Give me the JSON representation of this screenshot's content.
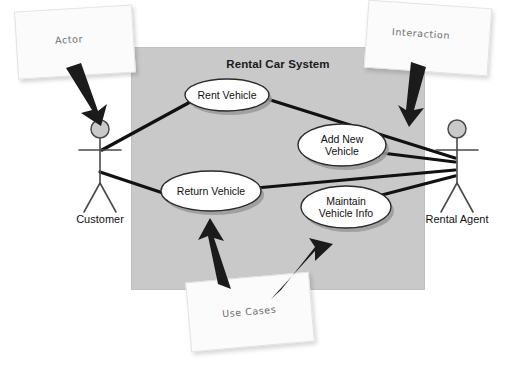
{
  "diagram": {
    "type": "uml-use-case-diagram",
    "system": {
      "title": "Rental Car System",
      "fill_color": "#c9c9c9"
    },
    "use_cases": [
      {
        "id": "rent-vehicle",
        "label": "Rent Vehicle"
      },
      {
        "id": "add-new-vehicle",
        "label": "Add New\nVehicle"
      },
      {
        "id": "return-vehicle",
        "label": "Return Vehicle"
      },
      {
        "id": "maintain-vehicle-info",
        "label": "Maintain\nVehicle Info"
      }
    ],
    "actors": [
      {
        "id": "customer",
        "label": "Customer"
      },
      {
        "id": "rental-agent",
        "label": "Rental Agent"
      }
    ],
    "annotations": [
      {
        "id": "actor-note",
        "label": "Actor"
      },
      {
        "id": "interaction-note",
        "label": "Interaction"
      },
      {
        "id": "use-cases-note",
        "label": "Use Cases"
      }
    ],
    "colors": {
      "line": "#111111",
      "ellipse_fill": "#ffffff",
      "ellipse_stroke": "#2b2b2b",
      "shadow": "#9a9a9a",
      "background": "#ffffff",
      "note_text": "#6e6e6e"
    }
  }
}
